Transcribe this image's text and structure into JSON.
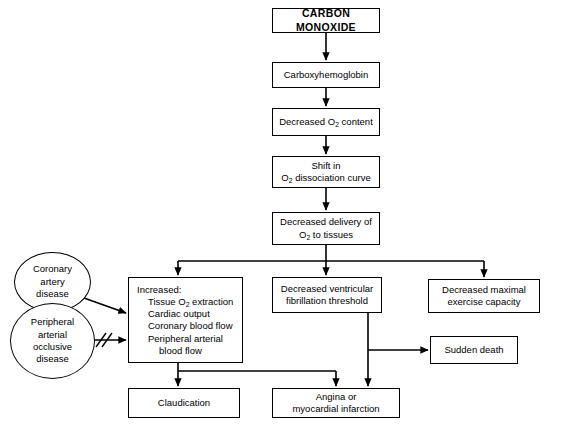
{
  "diagram": {
    "stroke_color": "#000000",
    "background_color": "#ffffff"
  },
  "nodes": {
    "carbon_monoxide": {
      "label": "CARBON MONOXIDE"
    },
    "carboxyhemoglobin": {
      "label": "Carboxyhemoglobin"
    },
    "decreased_o2_content": {
      "line1_a": "Decreased O",
      "line1_sub": "2",
      "line1_b": " content"
    },
    "shift_dissociation": {
      "line1": "Shift in",
      "line2_a": "O",
      "line2_sub": "2",
      "line2_b": " dissociation curve"
    },
    "decreased_delivery": {
      "line1": "Decreased delivery of",
      "line2_a": "O",
      "line2_sub": "2",
      "line2_b": " to tissues"
    },
    "increased_list": {
      "heading": "Increased:",
      "item1_a": "Tissue O",
      "item1_sub": "2",
      "item1_b": " extraction",
      "item2": "Cardiac output",
      "item3": "Coronary blood flow",
      "item4": "Peripheral arterial",
      "item5": "blood flow"
    },
    "decreased_ventricular": {
      "line1": "Decreased ventricular",
      "line2": "fibrillation threshold"
    },
    "decreased_maximal": {
      "line1": "Decreased maximal",
      "line2": "exercise capacity"
    },
    "sudden_death": {
      "label": "Sudden death"
    },
    "claudication": {
      "label": "Claudication"
    },
    "angina": {
      "line1": "Angina or",
      "line2": "myocardial infarction"
    },
    "coronary_artery_disease": {
      "line1": "Coronary",
      "line2": "artery",
      "line3": "disease"
    },
    "peripheral_arterial_disease": {
      "line1": "Peripheral",
      "line2": "arterial",
      "line3": "occlusive",
      "line4": "disease"
    }
  }
}
